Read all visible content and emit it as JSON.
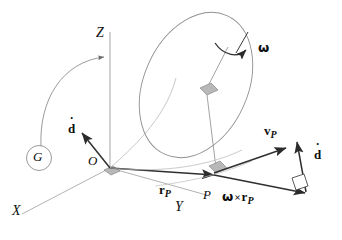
{
  "figure": {
    "background_color": "#ffffff",
    "ink_color": "#3f3f3f",
    "dark_ink_color": "#1a1a1a",
    "marker_fill": "#b8b8b8",
    "width": 342,
    "height": 240
  },
  "labels": {
    "axis_z": "Z",
    "axis_x": "X",
    "axis_y": "Y",
    "origin": "O",
    "point_p": "P",
    "body_g": "G",
    "omega": "ω",
    "cross": "×",
    "d_letter": "d",
    "dot_mark": "˙",
    "r_letter": "r",
    "v_letter": "v",
    "subscript_p": "P"
  },
  "vectors": [
    {
      "name": "r_P",
      "label_main": "r",
      "label_sub": "P",
      "from": "O",
      "to": "P",
      "description": "position vector from origin O to point P"
    },
    {
      "name": "v_P",
      "label_main": "v",
      "label_sub": "P",
      "from": "P",
      "description": "velocity of point P"
    },
    {
      "name": "omega_cross_r_P",
      "label_main": "ω × r",
      "label_sub": "P",
      "from": "P",
      "description": "rotational velocity contribution"
    },
    {
      "name": "d_dot_origin",
      "label_main": "d",
      "label_sub": "",
      "from": "O",
      "description": "translational velocity of the frame at O"
    },
    {
      "name": "d_dot_tip",
      "label_main": "d",
      "label_sub": "",
      "description": "translational velocity added at the tip of omega cross r_P"
    }
  ],
  "annotations": {
    "rotation_arrow": "ω spin direction about the disk axis",
    "g_leader": "leader arc from body label G to the Z axis",
    "right_angle_markers": 4
  }
}
